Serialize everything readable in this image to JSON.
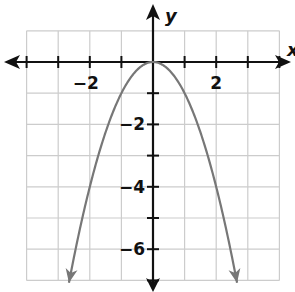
{
  "chart_data": {
    "type": "line",
    "title": "",
    "xlabel": "x",
    "ylabel": "y",
    "xlim": [
      -4.1,
      4.2
    ],
    "ylim": [
      -7,
      1
    ],
    "grid": true,
    "x_tick_labels": [
      "-2",
      "2"
    ],
    "y_tick_labels": [
      "-2",
      "-4",
      "-6"
    ],
    "series": [
      {
        "name": "parabola",
        "equation": "y = -x^2",
        "color": "#777777",
        "x": [
          -2.7,
          -2,
          -1,
          0,
          1,
          2,
          2.7
        ],
        "y": [
          -7.29,
          -4,
          -1,
          0,
          -1,
          -4,
          -7.29
        ],
        "arrows_at_ends": true
      }
    ]
  },
  "labels": {
    "x_axis": "x",
    "y_axis": "y",
    "x_ticks": [
      {
        "value": -2,
        "text": "−2"
      },
      {
        "value": 2,
        "text": "2"
      }
    ],
    "y_ticks": [
      {
        "value": -2,
        "text": "−2"
      },
      {
        "value": -4,
        "text": "−4"
      },
      {
        "value": -6,
        "text": "−6"
      }
    ]
  },
  "colors": {
    "axis": "#111111",
    "grid": "#cccccc",
    "curve": "#777777"
  }
}
